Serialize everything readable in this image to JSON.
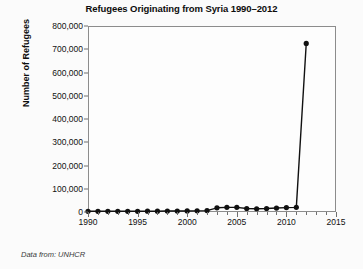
{
  "chart_data": {
    "type": "line",
    "title": "Refugees Originating from Syria 1990–2012",
    "xlabel": "",
    "ylabel": "Number of Refugees",
    "xlim": [
      1990,
      2015
    ],
    "ylim": [
      0,
      800000
    ],
    "grid": false,
    "legend": null,
    "source_note": "Data from: UNHCR",
    "x_ticks": [
      1990,
      1995,
      2000,
      2005,
      2010,
      2015
    ],
    "x_tick_labels": [
      "1990",
      "1995",
      "2000",
      "2005",
      "2010",
      "2015"
    ],
    "x_minor_tick_step": 1,
    "y_ticks": [
      0,
      100000,
      200000,
      300000,
      400000,
      500000,
      600000,
      700000,
      800000
    ],
    "y_tick_labels": [
      "0",
      "100,000",
      "200,000",
      "300,000",
      "400,000",
      "500,000",
      "600,000",
      "700,000",
      "800,000"
    ],
    "marker": "filled-circle",
    "line_color": "#111111",
    "marker_color": "#111111",
    "x": [
      1990,
      1991,
      1992,
      1993,
      1994,
      1995,
      1996,
      1997,
      1998,
      1999,
      2000,
      2001,
      2002,
      2003,
      2004,
      2005,
      2006,
      2007,
      2008,
      2009,
      2010,
      2011,
      2012
    ],
    "values": [
      3000,
      3000,
      3000,
      3000,
      3000,
      3000,
      3500,
      3500,
      4000,
      4000,
      4500,
      5000,
      6000,
      18000,
      20000,
      20000,
      15000,
      14000,
      15000,
      17000,
      19000,
      20000,
      725000
    ],
    "series": [
      {
        "name": "Refugees originating from Syria",
        "values": [
          3000,
          3000,
          3000,
          3000,
          3000,
          3000,
          3500,
          3500,
          4000,
          4000,
          4500,
          5000,
          6000,
          18000,
          20000,
          20000,
          15000,
          14000,
          15000,
          17000,
          19000,
          20000,
          725000
        ]
      }
    ]
  }
}
